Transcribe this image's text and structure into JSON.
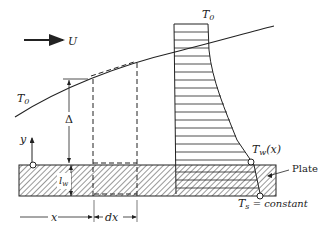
{
  "diagram": {
    "labels": {
      "freestream_velocity": "U",
      "freestream_temp_left": "T",
      "freestream_temp_left_sub": "0",
      "freestream_temp_top": "T",
      "freestream_temp_top_sub": "0",
      "boundary_thickness": "Δ",
      "y_axis": "y",
      "wall_thickness": "l",
      "wall_thickness_sub": "w",
      "x_coordinate": "x",
      "dx": "dx",
      "wall_temp": "T",
      "wall_temp_sub": "w",
      "wall_temp_arg": "(x)",
      "plate": "Plate",
      "source_temp": "T",
      "source_temp_sub": "s",
      "source_temp_suffix": " = constant"
    },
    "colors": {
      "line": "#222222",
      "background": "#ffffff"
    }
  }
}
